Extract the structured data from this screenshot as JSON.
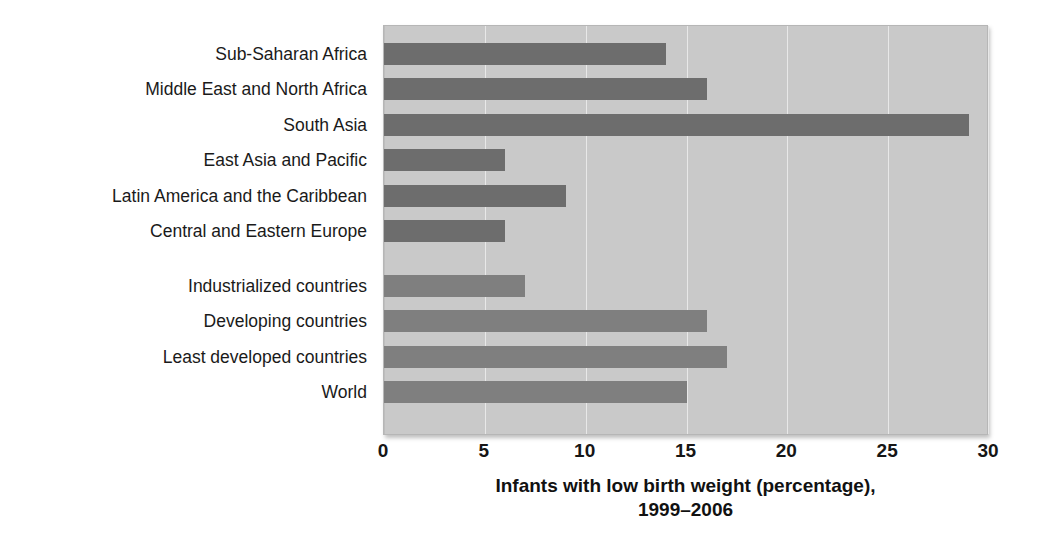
{
  "chart_data": {
    "type": "bar",
    "orientation": "horizontal",
    "title": "",
    "xlabel": "Infants with low birth weight (percentage), 1999–2006",
    "xlabel_lines": [
      "Infants with low birth weight (percentage),",
      "1999–2006"
    ],
    "ylabel": "",
    "xlim": [
      0,
      30
    ],
    "xticks": [
      0,
      5,
      10,
      15,
      20,
      25,
      30
    ],
    "xtick_labels": [
      "0",
      "5",
      "10",
      "15",
      "20",
      "25",
      "30"
    ],
    "grid": true,
    "grid_axis": "x",
    "legend": false,
    "categories": [
      "Sub-Saharan Africa",
      "Middle East and North Africa",
      "South Asia",
      "East Asia and Pacific",
      "Latin America and the Caribbean",
      "Central and Eastern Europe",
      "Industrialized countries",
      "Developing countries",
      "Least developed countries",
      "World"
    ],
    "values": [
      14,
      16,
      29,
      6,
      9,
      6,
      7,
      16,
      17,
      15
    ],
    "groups": [
      {
        "name": "regions",
        "color": "#6d6d6d",
        "categories": [
          "Sub-Saharan Africa",
          "Middle East and North Africa",
          "South Asia",
          "East Asia and Pacific",
          "Latin America and the Caribbean",
          "Central and Eastern Europe"
        ],
        "values": [
          14,
          16,
          29,
          6,
          9,
          6
        ]
      },
      {
        "name": "aggregates",
        "color": "#7f7f7f",
        "categories": [
          "Industrialized countries",
          "Developing countries",
          "Least developed countries",
          "World"
        ],
        "values": [
          7,
          16,
          17,
          15
        ]
      }
    ],
    "bars": [
      {
        "label": "Sub-Saharan Africa",
        "value": 14,
        "group": "regions",
        "color": "#6d6d6d",
        "row": 0
      },
      {
        "label": "Middle East and North Africa",
        "value": 16,
        "group": "regions",
        "color": "#6d6d6d",
        "row": 1
      },
      {
        "label": "South Asia",
        "value": 29,
        "group": "regions",
        "color": "#6d6d6d",
        "row": 2
      },
      {
        "label": "East Asia and Pacific",
        "value": 6,
        "group": "regions",
        "color": "#6d6d6d",
        "row": 3
      },
      {
        "label": "Latin America and the Caribbean",
        "value": 9,
        "group": "regions",
        "color": "#6d6d6d",
        "row": 4
      },
      {
        "label": "Central and Eastern Europe",
        "value": 6,
        "group": "regions",
        "color": "#6d6d6d",
        "row": 5
      },
      {
        "label": "Industrialized countries",
        "value": 7,
        "group": "aggregates",
        "color": "#7f7f7f",
        "row": 6.55
      },
      {
        "label": "Developing countries",
        "value": 16,
        "group": "aggregates",
        "color": "#7f7f7f",
        "row": 7.55
      },
      {
        "label": "Least developed countries",
        "value": 17,
        "group": "aggregates",
        "color": "#7f7f7f",
        "row": 8.55
      },
      {
        "label": "World",
        "value": 15,
        "group": "aggregates",
        "color": "#7f7f7f",
        "row": 9.55
      }
    ],
    "colors": {
      "plot_background": "#c9c9c9",
      "gridline": "#e8e8e8",
      "bar_region": "#6d6d6d",
      "bar_aggregate": "#7f7f7f",
      "text": "#1a1a1a"
    }
  }
}
